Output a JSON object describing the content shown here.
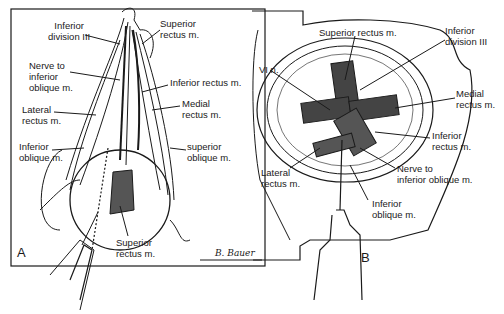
{
  "figure": {
    "panels": [
      {
        "id": "A",
        "letter": "A",
        "labels": [
          {
            "text": "Inferior\ndivision III",
            "x": 48,
            "y": 22
          },
          {
            "text": "Superior\nrectus m.",
            "x": 160,
            "y": 20
          },
          {
            "text": "Nerve to\ninferior\noblique m.",
            "x": 29,
            "y": 62
          },
          {
            "text": "Inferior rectus m.",
            "x": 170,
            "y": 78
          },
          {
            "text": "Lateral\nrectus m.",
            "x": 22,
            "y": 105
          },
          {
            "text": "Medial\nrectus m.",
            "x": 182,
            "y": 100
          },
          {
            "text": "Inferior\noblique m.",
            "x": 19,
            "y": 142
          },
          {
            "text": "superior\noblique m.",
            "x": 187,
            "y": 143
          },
          {
            "text": "Superior\nrectus m.",
            "x": 116,
            "y": 238
          }
        ],
        "signature": "B. Bauer"
      },
      {
        "id": "B",
        "letter": "B",
        "labels": [
          {
            "text": "Superior rectus m.",
            "x": 319,
            "y": 28
          },
          {
            "text": "Inferior\ndivision III",
            "x": 445,
            "y": 26
          },
          {
            "text": "VI n.",
            "x": 259,
            "y": 65
          },
          {
            "text": "Medial\nrectus m.",
            "x": 456,
            "y": 89
          },
          {
            "text": "Inferior\nrectus m.",
            "x": 432,
            "y": 130
          },
          {
            "text": "Lateral\nrectus m.",
            "x": 261,
            "y": 169
          },
          {
            "text": "Nerve to\ninferior oblique m.",
            "x": 397,
            "y": 164
          },
          {
            "text": "Inferior\noblique m.",
            "x": 372,
            "y": 198
          }
        ]
      }
    ]
  }
}
